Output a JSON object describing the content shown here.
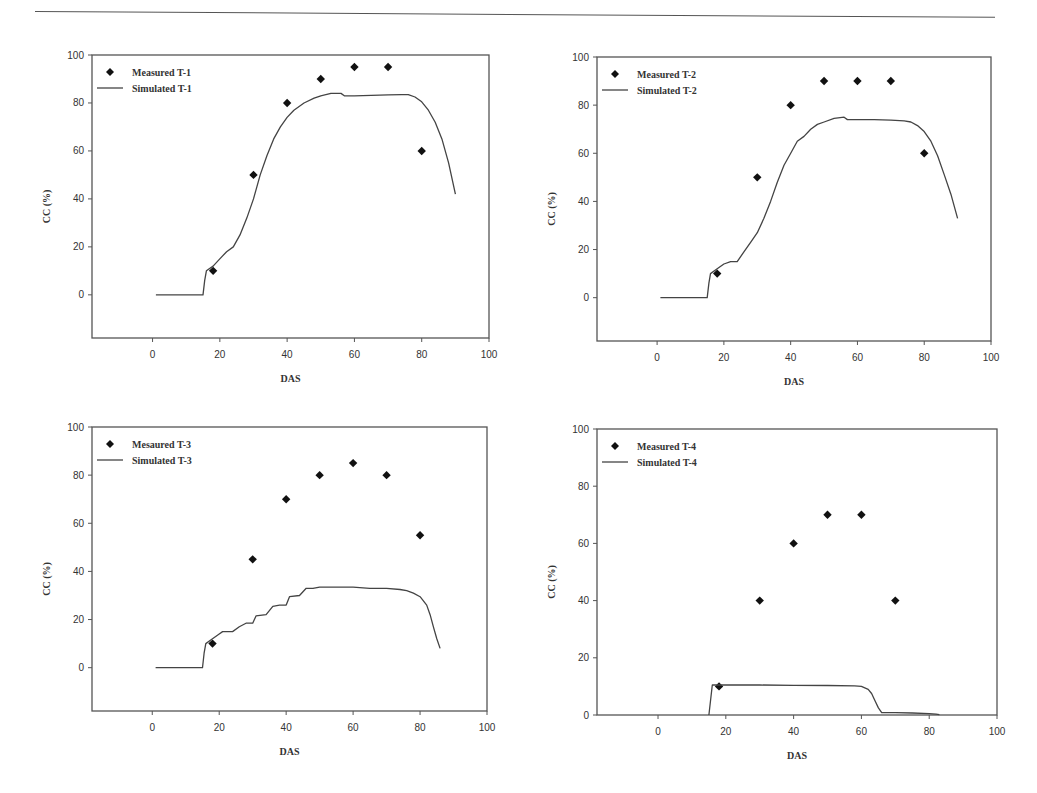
{
  "page": {
    "header_rule": true
  },
  "chart_data": [
    {
      "id": "t1",
      "type": "scatter+line",
      "title": "",
      "xlabel": "DAS",
      "ylabel": "CC (%)",
      "xlim": [
        -18,
        100
      ],
      "ylim": [
        -18,
        100
      ],
      "xticks": [
        0,
        20,
        40,
        60,
        80,
        100
      ],
      "yticks": [
        0,
        20,
        40,
        60,
        80,
        100
      ],
      "grid": false,
      "legend_position": "upper-left",
      "frame": {
        "left": 92,
        "top": 55,
        "right": 489,
        "bottom": 338
      },
      "series": [
        {
          "name": "Measured T-1",
          "kind": "scatter",
          "marker": "diamond",
          "x": [
            18,
            30,
            40,
            50,
            60,
            70,
            80
          ],
          "y": [
            10,
            50,
            80,
            90,
            95,
            95,
            60
          ]
        },
        {
          "name": "Simulated T-1",
          "kind": "line",
          "x": [
            1,
            15,
            15.5,
            16,
            18,
            20,
            22,
            24,
            26,
            28,
            30,
            32,
            34,
            36,
            38,
            40,
            42,
            45,
            48,
            50,
            53,
            56,
            57,
            58,
            60,
            65,
            70,
            74,
            76,
            78,
            80,
            82,
            84,
            86,
            88,
            90
          ],
          "y": [
            0,
            0,
            6,
            10,
            12,
            15,
            18,
            20,
            25,
            32,
            40,
            50,
            58,
            65,
            70,
            74,
            77,
            80,
            82,
            83,
            84,
            84,
            83,
            83,
            83,
            83.2,
            83.4,
            83.5,
            83.5,
            82.5,
            80.5,
            77,
            72,
            65,
            55,
            42
          ]
        }
      ]
    },
    {
      "id": "t2",
      "type": "scatter+line",
      "title": "",
      "xlabel": "DAS",
      "ylabel": "CC (%)",
      "xlim": [
        -18,
        100
      ],
      "ylim": [
        -18,
        100
      ],
      "xticks": [
        0,
        20,
        40,
        60,
        80,
        100
      ],
      "yticks": [
        0,
        20,
        40,
        60,
        80,
        100
      ],
      "grid": false,
      "legend_position": "upper-left",
      "frame": {
        "left": 597,
        "top": 57,
        "right": 991,
        "bottom": 341
      },
      "series": [
        {
          "name": "Measured T-2",
          "kind": "scatter",
          "marker": "diamond",
          "x": [
            18,
            30,
            40,
            50,
            60,
            70,
            80
          ],
          "y": [
            10,
            50,
            80,
            90,
            90,
            90,
            60
          ]
        },
        {
          "name": "Simulated T-2",
          "kind": "line",
          "x": [
            1,
            15,
            15.5,
            16,
            18,
            20,
            22,
            24,
            26,
            28,
            30,
            32,
            34,
            36,
            38,
            40,
            42,
            44,
            46,
            48,
            50,
            53,
            56,
            57,
            58,
            60,
            65,
            70,
            74,
            76,
            78,
            80,
            82,
            84,
            86,
            88,
            90
          ],
          "y": [
            0,
            0,
            6,
            10,
            12,
            14,
            15,
            15,
            19,
            23,
            27,
            33,
            40,
            48,
            55,
            60,
            65,
            67,
            70,
            72,
            73,
            74.5,
            75,
            74,
            74,
            74,
            74,
            73.8,
            73.5,
            73,
            71.5,
            69,
            65,
            59,
            51,
            43,
            33
          ]
        }
      ]
    },
    {
      "id": "t3",
      "type": "scatter+line",
      "title": "",
      "xlabel": "DAS",
      "ylabel": "CC (%)",
      "xlim": [
        -18,
        100
      ],
      "ylim": [
        -18,
        100
      ],
      "xticks": [
        0,
        20,
        40,
        60,
        80,
        100
      ],
      "yticks": [
        0,
        20,
        40,
        60,
        80,
        100
      ],
      "grid": false,
      "legend_position": "upper-left",
      "frame": {
        "left": 92,
        "top": 427,
        "right": 487,
        "bottom": 711
      },
      "series": [
        {
          "name": "Mesaured T-3",
          "kind": "scatter",
          "marker": "diamond",
          "x": [
            18,
            30,
            40,
            50,
            60,
            70,
            80
          ],
          "y": [
            10,
            45,
            70,
            80,
            85,
            80,
            55
          ]
        },
        {
          "name": "Simulated T-3",
          "kind": "line",
          "x": [
            1,
            15,
            15.5,
            16,
            18,
            20,
            21,
            24,
            26,
            28,
            30,
            31,
            34,
            36,
            38,
            40,
            41,
            44,
            46,
            48,
            50,
            55,
            60,
            65,
            70,
            74,
            76,
            78,
            80,
            82,
            83,
            84,
            85,
            86
          ],
          "y": [
            0,
            0,
            6,
            10,
            12,
            14,
            15,
            15,
            17,
            18.5,
            18.5,
            21.5,
            22,
            25.5,
            26,
            26,
            29.5,
            30,
            33,
            33,
            33.5,
            33.5,
            33.5,
            33,
            33,
            32.5,
            32,
            31,
            29.5,
            26,
            22,
            17,
            12,
            8
          ]
        }
      ]
    },
    {
      "id": "t4",
      "type": "scatter+line",
      "title": "",
      "xlabel": "DAS",
      "ylabel": "CC (%)",
      "xlim": [
        -18,
        100
      ],
      "ylim": [
        0,
        100
      ],
      "xticks": [
        0,
        20,
        40,
        60,
        80,
        100
      ],
      "yticks": [
        0,
        20,
        40,
        60,
        80,
        100
      ],
      "grid": false,
      "legend_position": "upper-left",
      "frame": {
        "left": 597,
        "top": 429,
        "right": 997,
        "bottom": 715
      },
      "series": [
        {
          "name": "Measured T-4",
          "kind": "scatter",
          "marker": "diamond",
          "x": [
            18,
            30,
            40,
            50,
            60,
            70
          ],
          "y": [
            10,
            40,
            60,
            70,
            70,
            40
          ]
        },
        {
          "name": "Simulated T-4",
          "kind": "line",
          "x": [
            15,
            16,
            20,
            30,
            40,
            50,
            58,
            60,
            62,
            63,
            64,
            65,
            66,
            70,
            75,
            80,
            82,
            83
          ],
          "y": [
            0,
            10.5,
            10.5,
            10.5,
            10.4,
            10.3,
            10.2,
            10,
            9,
            7.5,
            5,
            2.5,
            0.8,
            0.8,
            0.7,
            0.5,
            0.3,
            0.1
          ]
        }
      ]
    }
  ]
}
